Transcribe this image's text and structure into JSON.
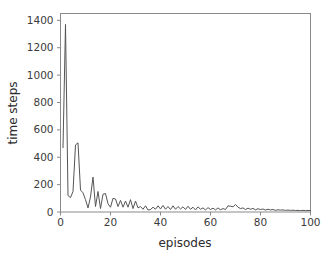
{
  "chart_data": {
    "type": "line",
    "title": "",
    "xlabel": "episodes",
    "ylabel": "time steps",
    "xlim": [
      0,
      100
    ],
    "ylim": [
      0,
      1450
    ],
    "xticks": [
      0,
      20,
      40,
      60,
      80,
      100
    ],
    "yticks": [
      0,
      200,
      400,
      600,
      800,
      1000,
      1200,
      1400
    ],
    "xtick_labels": [
      "0",
      "20",
      "40",
      "60",
      "80",
      "100"
    ],
    "ytick_labels": [
      "0",
      "200",
      "400",
      "600",
      "800",
      "1000",
      "1200",
      "1400"
    ],
    "grid": false,
    "legend": null,
    "line_color": "#555555",
    "background_color": "#ffffff",
    "spine_color": "#8a8a8a",
    "series": [
      {
        "name": "time steps per episode",
        "x": [
          1,
          2,
          3,
          4,
          5,
          6,
          7,
          8,
          9,
          10,
          11,
          12,
          13,
          14,
          15,
          16,
          17,
          18,
          19,
          20,
          21,
          22,
          23,
          24,
          25,
          26,
          27,
          28,
          29,
          30,
          31,
          32,
          33,
          34,
          35,
          36,
          37,
          38,
          39,
          40,
          41,
          42,
          43,
          44,
          45,
          46,
          47,
          48,
          49,
          50,
          51,
          52,
          53,
          54,
          55,
          56,
          57,
          58,
          59,
          60,
          61,
          62,
          63,
          64,
          65,
          66,
          67,
          68,
          69,
          70,
          71,
          72,
          73,
          74,
          75,
          76,
          77,
          78,
          79,
          80,
          81,
          82,
          83,
          84,
          85,
          86,
          87,
          88,
          89,
          90,
          91,
          92,
          93,
          94,
          95,
          96,
          97,
          98,
          99,
          100
        ],
        "values": [
          470,
          1370,
          120,
          105,
          150,
          490,
          505,
          160,
          140,
          90,
          30,
          110,
          255,
          40,
          150,
          25,
          130,
          135,
          60,
          35,
          100,
          95,
          40,
          85,
          35,
          80,
          35,
          90,
          25,
          80,
          30,
          40,
          20,
          45,
          15,
          18,
          35,
          20,
          45,
          22,
          48,
          20,
          40,
          18,
          45,
          20,
          40,
          22,
          38,
          18,
          42,
          20,
          35,
          15,
          38,
          20,
          30,
          15,
          32,
          18,
          28,
          15,
          30,
          16,
          25,
          18,
          45,
          42,
          38,
          55,
          35,
          25,
          30,
          18,
          28,
          20,
          26,
          16,
          24,
          18,
          22,
          14,
          20,
          15,
          18,
          12,
          16,
          14,
          15,
          12,
          14,
          12,
          13,
          11,
          12,
          10,
          12,
          10,
          11,
          10
        ]
      }
    ]
  },
  "axis": {
    "y_label_text": "time steps",
    "x_label_text": "episodes"
  }
}
